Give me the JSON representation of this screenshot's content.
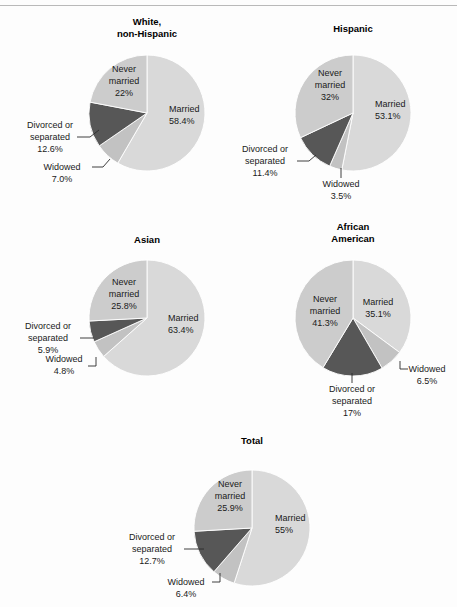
{
  "page": {
    "background": "#fdfdfd",
    "rule_color": "#b9b9b9",
    "width": 457,
    "height": 607
  },
  "colors": {
    "married": "#d9d9d9",
    "widowed": "#c2c2c2",
    "divorced": "#575757",
    "never_married": "#cccccc",
    "outline": "#ffffff",
    "text": "#1a1a1a",
    "leader": "#2b2b2b"
  },
  "chart_data": [
    {
      "type": "pie",
      "title": "White,\nnon-Hispanic",
      "title_lines": [
        "White,",
        "non-Hispanic"
      ],
      "categories": [
        "Married",
        "Widowed",
        "Divorced or separated",
        "Never married"
      ],
      "values": [
        58.4,
        7.0,
        12.6,
        22.0
      ],
      "labels": [
        "58.4%",
        "7.0%",
        "12.6%",
        "22%"
      ],
      "legend": "inside-and-callout"
    },
    {
      "type": "pie",
      "title": "Hispanic",
      "title_lines": [
        "Hispanic"
      ],
      "categories": [
        "Married",
        "Widowed",
        "Divorced or separated",
        "Never married"
      ],
      "values": [
        53.1,
        3.5,
        11.4,
        32.0
      ],
      "labels": [
        "53.1%",
        "3.5%",
        "11.4%",
        "32%"
      ],
      "legend": "inside-and-callout"
    },
    {
      "type": "pie",
      "title": "Asian",
      "title_lines": [
        "Asian"
      ],
      "categories": [
        "Married",
        "Widowed",
        "Divorced or separated",
        "Never married"
      ],
      "values": [
        63.4,
        4.8,
        5.9,
        25.8
      ],
      "labels": [
        "63.4%",
        "4.8%",
        "5.9%",
        "25.8%"
      ],
      "legend": "inside-and-callout"
    },
    {
      "type": "pie",
      "title": "African American",
      "title_lines": [
        "African",
        "American"
      ],
      "categories": [
        "Married",
        "Widowed",
        "Divorced or separated",
        "Never married"
      ],
      "values": [
        35.1,
        6.5,
        17.0,
        41.3
      ],
      "labels": [
        "35.1%",
        "6.5%",
        "17%",
        "41.3%"
      ],
      "legend": "inside-and-callout"
    },
    {
      "type": "pie",
      "title": "Total",
      "title_lines": [
        "Total"
      ],
      "categories": [
        "Married",
        "Widowed",
        "Divorced or separated",
        "Never married"
      ],
      "values": [
        55.0,
        6.4,
        12.7,
        25.9
      ],
      "labels": [
        "55%",
        "6.4%",
        "12.7%",
        "25.9%"
      ],
      "legend": "inside-and-callout"
    }
  ],
  "charts": {
    "white": {
      "title_line1": "White,",
      "title_line2": "non-Hispanic",
      "married_name": "Married",
      "married_value": "58.4%",
      "never_name1": "Never",
      "never_name2": "married",
      "never_value": "22%",
      "divorced_name1": "Divorced or",
      "divorced_name2": "separated",
      "divorced_value": "12.6%",
      "widowed_name": "Widowed",
      "widowed_value": "7.0%"
    },
    "hispanic": {
      "title_line1": "Hispanic",
      "married_name": "Married",
      "married_value": "53.1%",
      "never_name1": "Never",
      "never_name2": "married",
      "never_value": "32%",
      "divorced_name1": "Divorced or",
      "divorced_name2": "separated",
      "divorced_value": "11.4%",
      "widowed_name": "Widowed",
      "widowed_value": "3.5%"
    },
    "asian": {
      "title_line1": "Asian",
      "married_name": "Married",
      "married_value": "63.4%",
      "never_name1": "Never",
      "never_name2": "married",
      "never_value": "25.8%",
      "divorced_name1": "Divorced or",
      "divorced_name2": "separated",
      "divorced_value": "5.9%",
      "widowed_name": "Widowed",
      "widowed_value": "4.8%"
    },
    "african": {
      "title_line1": "African",
      "title_line2": "American",
      "married_name": "Married",
      "married_value": "35.1%",
      "never_name1": "Never",
      "never_name2": "married",
      "never_value": "41.3%",
      "divorced_name1": "Divorced or",
      "divorced_name2": "separated",
      "divorced_value": "17%",
      "widowed_name": "Widowed",
      "widowed_value": "6.5%"
    },
    "total": {
      "title_line1": "Total",
      "married_name": "Married",
      "married_value": "55%",
      "never_name1": "Never",
      "never_name2": "married",
      "never_value": "25.9%",
      "divorced_name1": "Divorced or",
      "divorced_name2": "separated",
      "divorced_value": "12.7%",
      "widowed_name": "Widowed",
      "widowed_value": "6.4%"
    }
  }
}
